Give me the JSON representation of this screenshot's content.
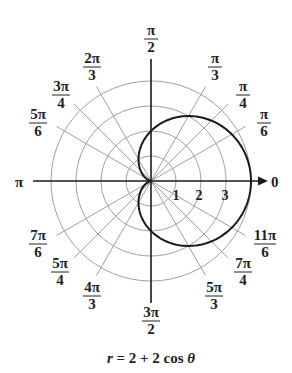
{
  "chart_data": {
    "type": "polar-line",
    "title": "",
    "caption": "r = 2 + 2 cos θ",
    "equation": {
      "r": "2 + 2 cos θ",
      "a": 2,
      "b": 2
    },
    "radial_ticks": [
      "1",
      "2",
      "3"
    ],
    "radial_grid": [
      1,
      2,
      3,
      4
    ],
    "rlim": [
      0,
      4
    ],
    "angle_labels": [
      {
        "num": "π",
        "den": "2",
        "angle_deg": 90
      },
      {
        "num": "π",
        "den": "3",
        "angle_deg": 60
      },
      {
        "num": "π",
        "den": "4",
        "angle_deg": 45
      },
      {
        "num": "π",
        "den": "6",
        "angle_deg": 30
      },
      {
        "num": "0",
        "den": "",
        "angle_deg": 0
      },
      {
        "num": "11π",
        "den": "6",
        "angle_deg": 330
      },
      {
        "num": "7π",
        "den": "4",
        "angle_deg": 315
      },
      {
        "num": "5π",
        "den": "3",
        "angle_deg": 300
      },
      {
        "num": "3π",
        "den": "2",
        "angle_deg": 270
      },
      {
        "num": "4π",
        "den": "3",
        "angle_deg": 240
      },
      {
        "num": "5π",
        "den": "4",
        "angle_deg": 225
      },
      {
        "num": "7π",
        "den": "6",
        "angle_deg": 210
      },
      {
        "num": "π",
        "den": "",
        "angle_deg": 180
      },
      {
        "num": "5π",
        "den": "6",
        "angle_deg": 150
      },
      {
        "num": "3π",
        "den": "4",
        "angle_deg": 135
      },
      {
        "num": "2π",
        "den": "3",
        "angle_deg": 120
      }
    ],
    "series": [
      {
        "name": "cardioid",
        "theta_deg": [
          0,
          30,
          45,
          60,
          90,
          120,
          135,
          150,
          180,
          210,
          225,
          240,
          270,
          300,
          315,
          330,
          360
        ],
        "r": [
          4,
          3.73,
          3.41,
          3,
          2,
          1,
          0.59,
          0.27,
          0,
          0.27,
          0.59,
          1,
          2,
          3,
          3.41,
          3.73,
          4
        ]
      }
    ],
    "grid": true,
    "colors": {
      "curve": "#1a1a1a",
      "grid": "#9a9a9a",
      "axis": "#1a1a1a"
    }
  },
  "labels": {
    "pi_half_num": "π",
    "pi_half_den": "2",
    "pi_third_num": "π",
    "pi_third_den": "3",
    "pi_quarter_num": "π",
    "pi_quarter_den": "4",
    "pi_sixth_num": "π",
    "pi_sixth_den": "6",
    "zero": "0",
    "eleven_sixth_num": "11π",
    "eleven_sixth_den": "6",
    "seven_quarter_num": "7π",
    "seven_quarter_den": "4",
    "five_third_num": "5π",
    "five_third_den": "3",
    "three_half_num": "3π",
    "three_half_den": "2",
    "four_third_num": "4π",
    "four_third_den": "3",
    "five_quarter_num": "5π",
    "five_quarter_den": "4",
    "seven_sixth_num": "7π",
    "seven_sixth_den": "6",
    "pi": "π",
    "five_sixth_num": "5π",
    "five_sixth_den": "6",
    "three_quarter_num": "3π",
    "three_quarter_den": "4",
    "two_third_num": "2π",
    "two_third_den": "3",
    "tick1": "1",
    "tick2": "2",
    "tick3": "3"
  },
  "caption": {
    "r": "r",
    "eq": " = 2 + 2 cos ",
    "theta": "θ"
  }
}
